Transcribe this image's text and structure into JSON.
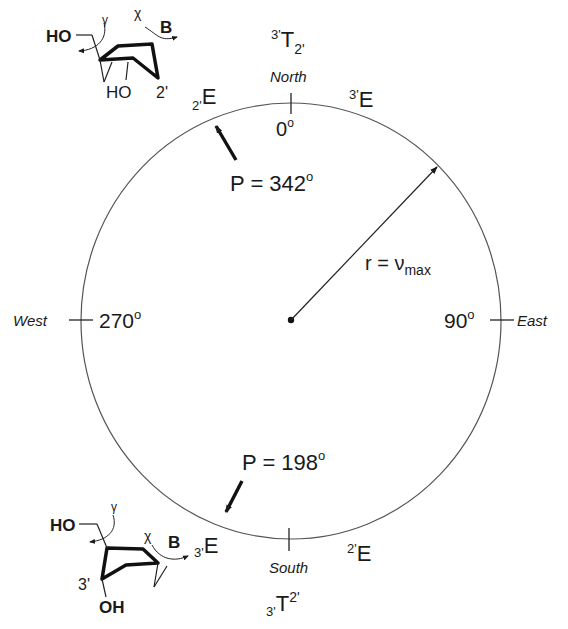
{
  "diagram": {
    "type": "pseudorotation-wheel",
    "compass": {
      "north": {
        "label": "North",
        "angle": "0",
        "unit": "o"
      },
      "east": {
        "label": "East",
        "angle": "90",
        "unit": "o"
      },
      "south": {
        "label": "South"
      },
      "west": {
        "label": "West",
        "angle": "270",
        "unit": "o"
      }
    },
    "conformers": {
      "top": {
        "sup": "3'",
        "main": "T",
        "sub": "2'"
      },
      "bottom": {
        "sub": "3'",
        "main": "T",
        "sup": "2'"
      },
      "c2_endo": {
        "sub": "2'",
        "main": "E"
      },
      "c3_endo": {
        "sup": "3'",
        "main": "E"
      },
      "c3_exo": {
        "sub": "3'",
        "main": "E"
      },
      "c2_exo": {
        "sup": "2'",
        "main": "E"
      }
    },
    "phase_markers": [
      {
        "label": "P = 342",
        "unit": "o"
      },
      {
        "label": "P = 198",
        "unit": "o"
      }
    ],
    "radius_label": {
      "prefix": "r = ",
      "symbol": "ν",
      "sub": "max"
    },
    "structures": {
      "top": {
        "ho5": "HO",
        "ho3": "HO",
        "base": "B",
        "atom": "2'",
        "gamma": "γ",
        "chi": "χ"
      },
      "bottom": {
        "ho5": "HO",
        "oh3": "OH",
        "base": "B",
        "atom": "3'",
        "gamma": "γ",
        "chi": "χ"
      }
    }
  }
}
